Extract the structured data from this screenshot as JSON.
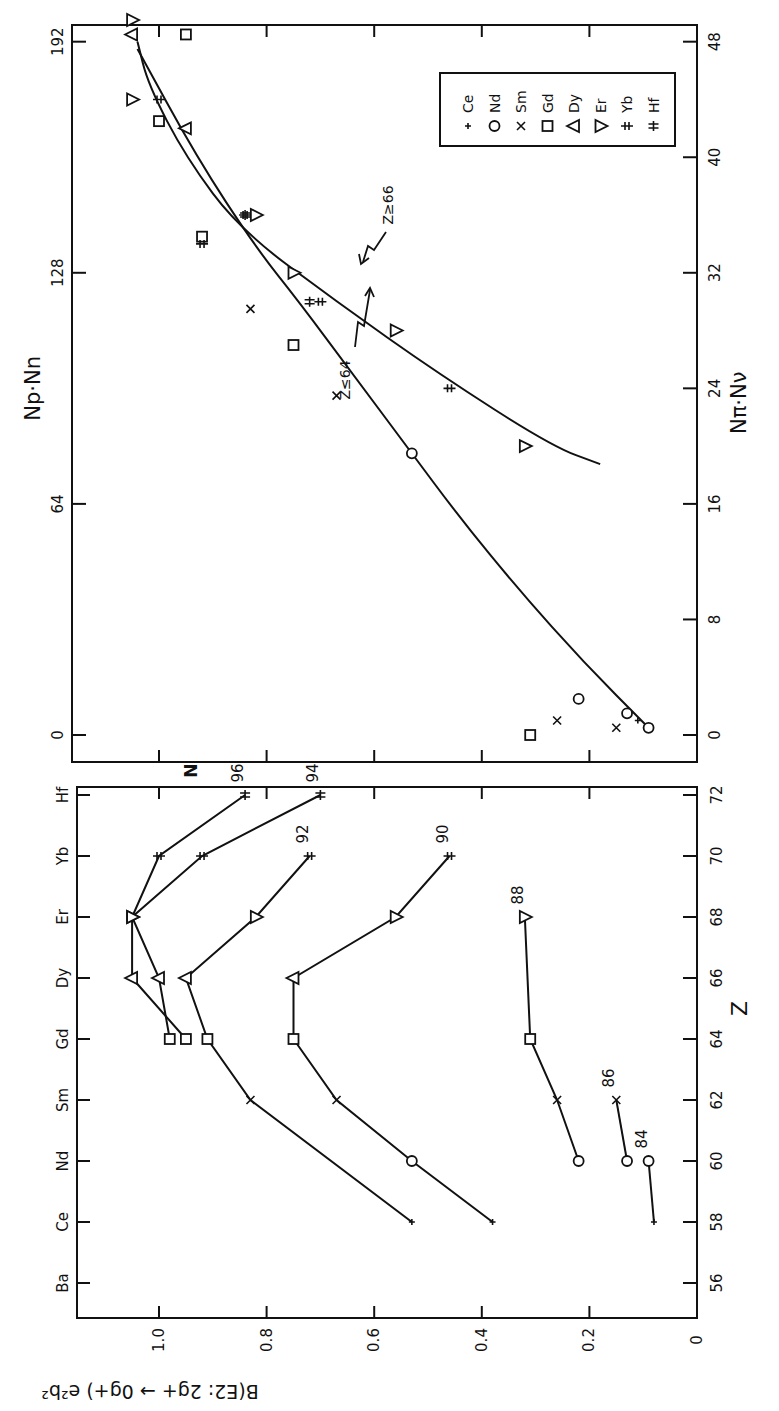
{
  "chart_data": [
    {
      "panel": "lower",
      "type": "line",
      "title": "",
      "xlabel": "Z",
      "ylabel": "B(E2: 2g+ → 0g+) e²b²",
      "ylim": [
        0,
        1.1
      ],
      "xlim": [
        55,
        74
      ],
      "x_ticks": [
        56,
        58,
        60,
        62,
        64,
        66,
        68,
        70,
        72
      ],
      "y_ticks": [
        "0",
        "0.2",
        "0.4",
        "0.6",
        "0.8",
        "1.0"
      ],
      "element_labels": [
        {
          "z": 56,
          "label": "Ba"
        },
        {
          "z": 58,
          "label": "Ce"
        },
        {
          "z": 60,
          "label": "Nd"
        },
        {
          "z": 62,
          "label": "Sm"
        },
        {
          "z": 64,
          "label": "Gd"
        },
        {
          "z": 66,
          "label": "Dy"
        },
        {
          "z": 68,
          "label": "Er"
        },
        {
          "z": 70,
          "label": "Yb"
        },
        {
          "z": 72,
          "label": "Hf"
        }
      ],
      "series_header": "N",
      "series": [
        {
          "name": "84",
          "x": [
            58,
            60
          ],
          "values": [
            0.08,
            0.09
          ]
        },
        {
          "name": "86",
          "x": [
            60,
            62
          ],
          "values": [
            0.13,
            0.15
          ]
        },
        {
          "name": "88",
          "x": [
            60,
            62,
            64,
            68
          ],
          "values": [
            0.22,
            0.26,
            0.31,
            0.32
          ]
        },
        {
          "name": "90",
          "x": [
            58,
            60,
            62,
            64,
            66,
            68,
            70
          ],
          "values": [
            0.38,
            0.53,
            0.67,
            0.75,
            0.75,
            0.56,
            0.46
          ]
        },
        {
          "name": "92",
          "x": [
            58,
            62,
            64,
            66,
            68,
            70
          ],
          "values": [
            0.53,
            0.83,
            0.91,
            0.95,
            0.82,
            0.72
          ]
        },
        {
          "name": "94",
          "x": [
            64,
            66,
            68,
            70,
            72
          ],
          "values": [
            0.95,
            1.05,
            1.05,
            0.92,
            0.7
          ]
        },
        {
          "name": "96",
          "x": [
            64,
            66,
            68,
            70,
            72
          ],
          "values": [
            0.98,
            1.0,
            1.05,
            1.0,
            0.84
          ]
        }
      ]
    },
    {
      "panel": "upper",
      "type": "scatter",
      "title": "",
      "xlabel": "Np·Nn",
      "xlabel_secondary": "Nπ·Nν",
      "ylabel": "B(E2: 2g+ → 0g+) e²b²",
      "xlim": [
        0,
        200
      ],
      "x_ticks_top": [
        0,
        64,
        128,
        192
      ],
      "x_ticks_bottom": [
        0,
        8,
        16,
        24,
        32,
        40,
        48
      ],
      "legend_position": "upper right (rotated)",
      "legend": [
        {
          "symbol": "+",
          "label": "Ce"
        },
        {
          "symbol": "○",
          "label": "Nd"
        },
        {
          "symbol": "×",
          "label": "Sm"
        },
        {
          "symbol": "□",
          "label": "Gd"
        },
        {
          "symbol": "△",
          "label": "Dy"
        },
        {
          "symbol": "▽",
          "label": "Er"
        },
        {
          "symbol": "‡",
          "label": "Yb"
        },
        {
          "symbol": "⧺",
          "label": "Hf"
        }
      ],
      "curves": [
        {
          "name": "Z≤64",
          "x": [
            2,
            20,
            40,
            60,
            80,
            100,
            120,
            135,
            160,
            190
          ],
          "values": [
            0.09,
            0.21,
            0.33,
            0.44,
            0.54,
            0.64,
            0.74,
            0.82,
            0.93,
            1.04
          ]
        },
        {
          "name": "Z≥66",
          "x": [
            75,
            80,
            100,
            120,
            140,
            160,
            180,
            192
          ],
          "values": [
            0.18,
            0.27,
            0.48,
            0.67,
            0.85,
            0.95,
            1.02,
            1.04
          ]
        }
      ],
      "annotations": [
        "Z≤64",
        "Z≥66"
      ],
      "points": [
        {
          "el": "Ce",
          "x": 4,
          "values": 0.11
        },
        {
          "el": "Nd",
          "x": 2,
          "values": 0.09
        },
        {
          "el": "Nd",
          "x": 6,
          "values": 0.13
        },
        {
          "el": "Nd",
          "x": 10,
          "values": 0.22
        },
        {
          "el": "Nd",
          "x": 78,
          "values": 0.53
        },
        {
          "el": "Sm",
          "x": 2,
          "values": 0.15
        },
        {
          "el": "Sm",
          "x": 4,
          "values": 0.26
        },
        {
          "el": "Sm",
          "x": 94,
          "values": 0.67
        },
        {
          "el": "Sm",
          "x": 118,
          "values": 0.83
        },
        {
          "el": "Gd",
          "x": 0,
          "values": 0.31
        },
        {
          "el": "Gd",
          "x": 108,
          "values": 0.75
        },
        {
          "el": "Gd",
          "x": 138,
          "values": 0.92
        },
        {
          "el": "Gd",
          "x": 170,
          "values": 1.0
        },
        {
          "el": "Gd",
          "x": 194,
          "values": 0.95
        },
        {
          "el": "Dy",
          "x": 168,
          "values": 0.95
        },
        {
          "el": "Dy",
          "x": 194,
          "values": 1.05
        },
        {
          "el": "Er",
          "x": 80,
          "values": 0.32
        },
        {
          "el": "Er",
          "x": 112,
          "values": 0.56
        },
        {
          "el": "Er",
          "x": 128,
          "values": 0.75
        },
        {
          "el": "Er",
          "x": 144,
          "values": 0.82
        },
        {
          "el": "Er",
          "x": 176,
          "values": 1.05
        },
        {
          "el": "Er",
          "x": 198,
          "values": 1.05
        },
        {
          "el": "Yb",
          "x": 96,
          "values": 0.46
        },
        {
          "el": "Yb",
          "x": 120,
          "values": 0.7
        },
        {
          "el": "Yb",
          "x": 136,
          "values": 0.92
        },
        {
          "el": "Yb",
          "x": 144,
          "values": 0.84
        },
        {
          "el": "Yb",
          "x": 176,
          "values": 1.0
        },
        {
          "el": "Hf",
          "x": 120,
          "values": 0.72
        },
        {
          "el": "Hf",
          "x": 144,
          "values": 0.84
        }
      ]
    }
  ]
}
